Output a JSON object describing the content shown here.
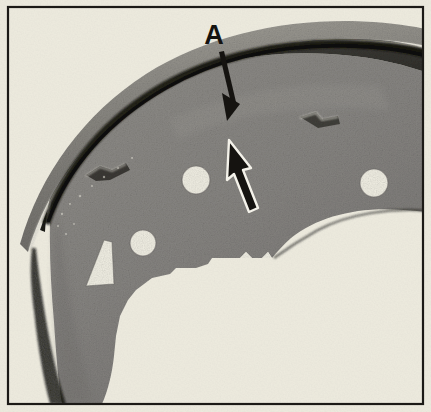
{
  "figure": {
    "domain": "scanned-photograph",
    "caption_letters": [
      {
        "id": "A",
        "text": "A",
        "x": 214,
        "y": 36,
        "points_to": "gap between friction lining and brake shoe rim"
      }
    ],
    "annotations": {
      "pointer_arrow_top": {
        "name": "callout-arrow-a",
        "style": "solid-black",
        "from": [
          221,
          48
        ],
        "to": [
          237,
          114
        ],
        "description": "black arrow from letter A pointing down-right to lining edge"
      },
      "pointer_arrow_lining": {
        "name": "lining-gap-arrow",
        "style": "black-filled-white-outline",
        "from": [
          252,
          210
        ],
        "to": [
          233,
          142
        ],
        "description": "white-outlined black arrow pointing up-left at the lining-to-shoe interface"
      }
    },
    "frame": {
      "border_color": "#1c1a16",
      "border_width_px": 2,
      "inset_px": 7,
      "paper_color": "#f0eee3"
    },
    "palette": {
      "paper": "#f0eee3",
      "paper_warm": "#eceadd",
      "border": "#1c1a16",
      "lining_mid_gray": "#8f8d88",
      "lining_light": "#b9b7b0",
      "web_gray": "#8a8884",
      "web_gray_dark": "#75736f",
      "shadow_dark": "#2a2824",
      "shadow_deep": "#171511",
      "highlight_line": "#d8d6ce",
      "hole_fill": "#efede2",
      "ink_black": "#151310",
      "arrow_outline_white": "#f4f2ea"
    },
    "parts": [
      {
        "name": "friction-lining",
        "description": "curved dark band along the outer arc of the shoe, upper edge of assembly"
      },
      {
        "name": "lining-shoe-gap",
        "description": "dark shadow line separating lining from shoe rim, indicated by arrow A"
      },
      {
        "name": "shoe-rim",
        "description": "metal table/rim the lining is bonded to"
      },
      {
        "name": "shoe-web",
        "description": "flat gray web plate with lightening holes and castellated lower edge"
      }
    ],
    "holes": [
      {
        "name": "web-hole-left",
        "cx": 143,
        "cy": 243,
        "r": 13
      },
      {
        "name": "web-hole-center",
        "cx": 196,
        "cy": 180,
        "r": 14
      },
      {
        "name": "web-hole-right",
        "cx": 374,
        "cy": 183,
        "r": 14
      }
    ],
    "cutouts": [
      {
        "name": "triangular-cutout",
        "cx": 101,
        "cy": 263,
        "description": "small tapered triangular slot in web"
      }
    ],
    "texture": {
      "name": "halftone-dot-screen",
      "description": "newsprint halftone grain over the whole photographic area"
    }
  }
}
